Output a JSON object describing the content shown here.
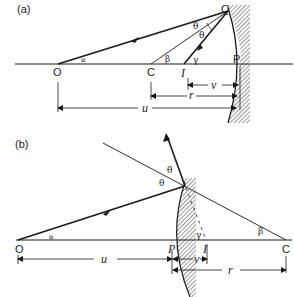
{
  "figure": {
    "panels": [
      {
        "id": "a",
        "label": "(a)",
        "mirror_type": "concave",
        "points": {
          "O": "O",
          "C": "C",
          "I": "I",
          "P": "P",
          "Q": "Q"
        },
        "angles": {
          "alpha": "∝",
          "beta": "β",
          "gamma": "γ",
          "theta1": "θ",
          "theta2": "θ"
        },
        "distances": {
          "u": "u",
          "v": "v",
          "r": "r"
        }
      },
      {
        "id": "b",
        "label": "(b)",
        "mirror_type": "convex",
        "points": {
          "O": "O",
          "C": "C",
          "I": "I",
          "P": "P"
        },
        "angles": {
          "alpha": "∝",
          "beta": "β",
          "gamma": "γ",
          "theta1": "θ",
          "theta2": "θ"
        },
        "distances": {
          "u": "u",
          "v": "v",
          "r": "r"
        }
      }
    ]
  },
  "colors": {
    "line": "#1a1a1a",
    "background": "#ffffff",
    "hatch": "#333333"
  }
}
